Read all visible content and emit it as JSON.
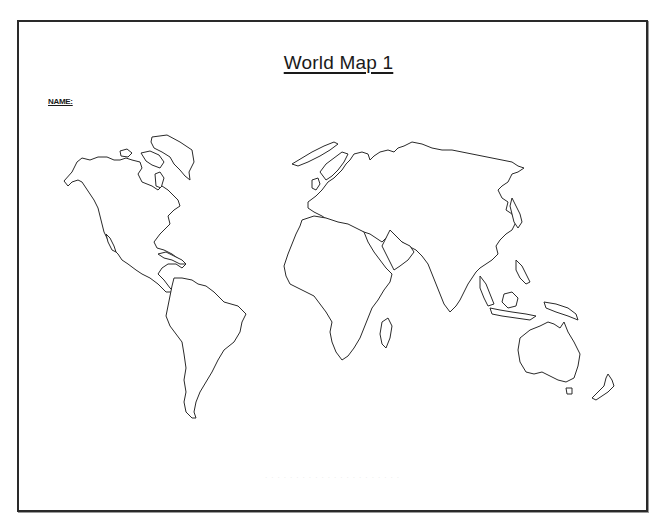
{
  "worksheet": {
    "title": "World Map  1",
    "name_label": "NAME:",
    "footer_note": "· · · · ·   · · · · · · · · ·   · · · · · · · ·",
    "border_color": "#2a2a2a",
    "line_color": "#2a2a2a",
    "background_color": "#ffffff"
  },
  "map": {
    "style": "blank outline",
    "continents": [
      {
        "id": "north-america",
        "label": "North America"
      },
      {
        "id": "greenland",
        "label": "Greenland"
      },
      {
        "id": "south-america",
        "label": "South America"
      },
      {
        "id": "europe-asia",
        "label": "Eurasia"
      },
      {
        "id": "africa",
        "label": "Africa"
      },
      {
        "id": "australia",
        "label": "Australia"
      }
    ]
  }
}
